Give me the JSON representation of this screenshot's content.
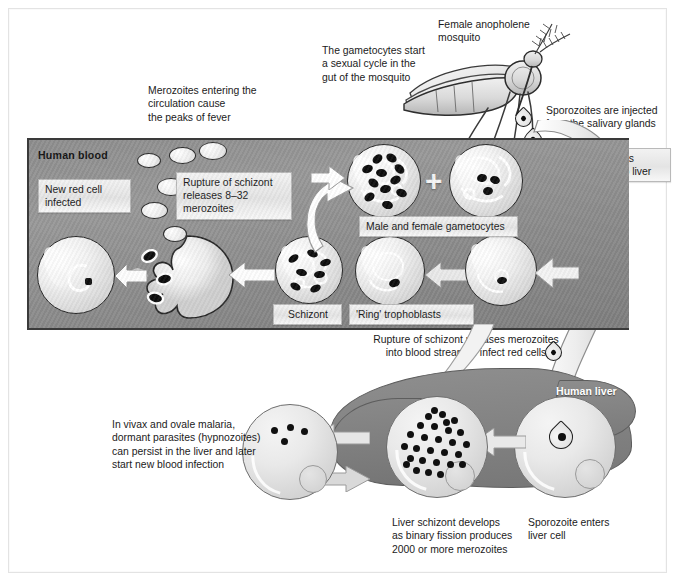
{
  "figure": {
    "domain_title": "Malaria parasite life cycle",
    "background": "#ffffff",
    "frame_color": "#e3e3e3"
  },
  "annotations": {
    "gametocytes_cycle": "The gametocytes start\na sexual cycle in the\ngut of the mosquito",
    "mosquito": "Female anopholene\nmosquito",
    "merozoites_fever": "Merozoites entering the\ncirculation cause\nthe peaks of fever",
    "sporozoites_injected": "Sporozoites are injected\nfrom the salivary glands",
    "rupture_releases": "Rupture of schizont releases merozoites\ninto blood stream to infect red cells",
    "vivax_ovale": "In vivax and ovale malaria,\ndormant parasites (hypnozoites)\ncan persist in the liver and later\nstart new blood infection",
    "liver_schizont": "Liver schizont develops\nas binary fission produces\n2000 or more merozoites",
    "sporozoite_enters": "Sporozoite enters\nliver cell"
  },
  "box_labels": {
    "new_red_cell": "New red cell\ninfected",
    "rupture_schizont": "Rupture of schizont\nreleases 8–32\nmerozoites",
    "male_female_gametocytes": "Male and female gametocytes",
    "schizont": "Schizont",
    "ring_trophoblasts": "'Ring' trophoblasts",
    "sporozoites_circulate": "Sporozoites\ncirculate to liver"
  },
  "band_labels": {
    "human_blood": "Human blood",
    "human_liver": "Human liver"
  },
  "symbols": {
    "plus": "+"
  },
  "colors": {
    "blood_band": "#909090",
    "liver": "#848484",
    "parasite": "#101010",
    "cell_fill": "#f0f0f0",
    "label_box": "#e9e9e9",
    "outline": "#2a2a2a"
  },
  "counts": {
    "free_merozoites": 6,
    "ribbon_sporozoites": 5,
    "liver_schizont_dots": 28,
    "hypnozoites": 4,
    "male_gametocyte_rods": 11,
    "female_gametocyte_rods": 3,
    "schizont_rods": 7
  }
}
